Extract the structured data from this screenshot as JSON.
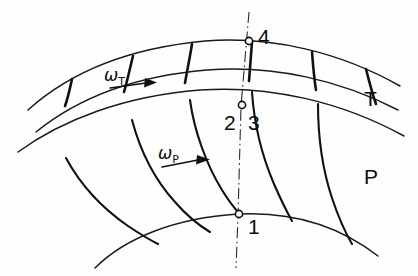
{
  "figure": {
    "type": "engineering-diagram",
    "background_color": "#fefefe",
    "line_color": "#111111",
    "width": 418,
    "height": 276
  },
  "rows": {
    "turbine": {
      "label": "T",
      "omega_symbol": "ω",
      "omega_subscript": "T",
      "blade_count": 5
    },
    "pump": {
      "label": "P",
      "omega_symbol": "ω",
      "omega_subscript": "P",
      "blade_count": 5
    }
  },
  "stations": [
    {
      "id": "1",
      "label": "1",
      "x": 238,
      "y": 215,
      "location": "pump-inner-arc"
    },
    {
      "id": "2",
      "label": "2",
      "x": 241,
      "y": 106,
      "location": "interface-left"
    },
    {
      "id": "3",
      "label": "3",
      "x": 241,
      "y": 106,
      "location": "interface-right"
    },
    {
      "id": "4",
      "label": "4",
      "x": 248,
      "y": 40,
      "location": "turbine-outer-arc"
    }
  ],
  "centerline": {
    "style": "dash-dot",
    "description": "vertical reference axis through stations 1, 2/3 and 4"
  },
  "arrows": [
    {
      "name": "omega-t-arrow",
      "direction": "right",
      "row": "turbine"
    },
    {
      "name": "omega-p-arrow",
      "direction": "right",
      "row": "pump"
    }
  ]
}
